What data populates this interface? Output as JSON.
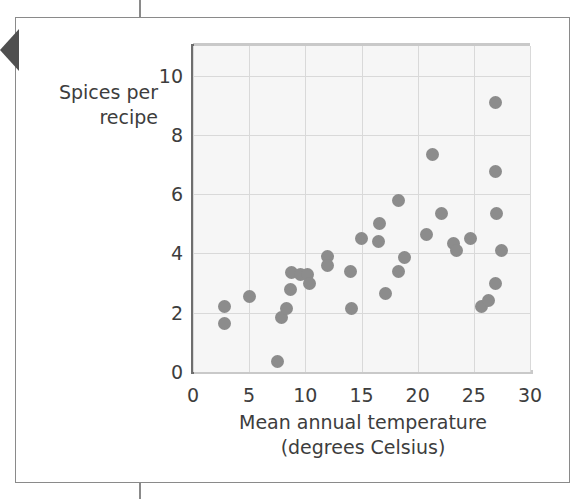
{
  "page": {
    "frame_border_color": "#8a8a8a",
    "tab_marker_color": "#4f4f4f",
    "background": "#ffffff"
  },
  "chart_data": {
    "type": "scatter",
    "title": "",
    "xlabel": "Mean annual temperature\n(degrees Celsius)",
    "ylabel": "Spices per\nrecipe",
    "xlim": [
      0,
      30
    ],
    "ylim": [
      0,
      11
    ],
    "xticks": [
      0,
      5,
      10,
      15,
      20,
      25,
      30
    ],
    "yticks": [
      0,
      2,
      4,
      6,
      8,
      10
    ],
    "xtick_labels": [
      "0",
      "5",
      "10",
      "15",
      "20",
      "25",
      "30"
    ],
    "ytick_labels": [
      "0",
      "2",
      "4",
      "6",
      "8",
      "10"
    ],
    "grid": true,
    "grid_color": "#d9d9d9",
    "plot_background": "#f6f6f6",
    "marker_color": "#8c8c8c",
    "marker_size": 13,
    "legend": null,
    "points": [
      {
        "x": 2.8,
        "y": 2.2
      },
      {
        "x": 2.8,
        "y": 1.65
      },
      {
        "x": 5.0,
        "y": 2.55
      },
      {
        "x": 7.5,
        "y": 0.35
      },
      {
        "x": 7.9,
        "y": 1.85
      },
      {
        "x": 8.3,
        "y": 2.15
      },
      {
        "x": 8.7,
        "y": 2.8
      },
      {
        "x": 8.8,
        "y": 3.35
      },
      {
        "x": 9.6,
        "y": 3.3
      },
      {
        "x": 10.2,
        "y": 3.3
      },
      {
        "x": 10.4,
        "y": 3.0
      },
      {
        "x": 12.0,
        "y": 3.9
      },
      {
        "x": 12.0,
        "y": 3.6
      },
      {
        "x": 14.0,
        "y": 3.4
      },
      {
        "x": 14.1,
        "y": 2.15
      },
      {
        "x": 15.0,
        "y": 4.5
      },
      {
        "x": 16.5,
        "y": 4.4
      },
      {
        "x": 16.6,
        "y": 5.0
      },
      {
        "x": 17.1,
        "y": 2.65
      },
      {
        "x": 18.3,
        "y": 5.8
      },
      {
        "x": 18.3,
        "y": 3.4
      },
      {
        "x": 18.8,
        "y": 3.85
      },
      {
        "x": 20.8,
        "y": 4.65
      },
      {
        "x": 21.3,
        "y": 7.35
      },
      {
        "x": 22.1,
        "y": 5.35
      },
      {
        "x": 23.2,
        "y": 4.35
      },
      {
        "x": 23.5,
        "y": 4.1
      },
      {
        "x": 24.7,
        "y": 4.5
      },
      {
        "x": 25.7,
        "y": 2.2
      },
      {
        "x": 26.3,
        "y": 2.4
      },
      {
        "x": 26.9,
        "y": 3.0
      },
      {
        "x": 26.9,
        "y": 9.1
      },
      {
        "x": 26.9,
        "y": 6.75
      },
      {
        "x": 27.0,
        "y": 5.35
      },
      {
        "x": 27.5,
        "y": 4.1
      }
    ]
  }
}
